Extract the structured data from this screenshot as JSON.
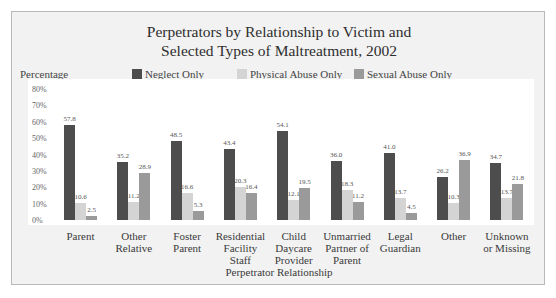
{
  "chart_data": {
    "type": "bar",
    "title": "Perpetrators by Relationship to Victim and Selected Types of Maltreatment, 2002",
    "title_lines": [
      "Perpetrators by Relationship to Victim and",
      "Selected Types of Maltreatment, 2002"
    ],
    "xlabel": "Perpetrator Relationship",
    "ylabel": "Percentage",
    "ylim": [
      0,
      80
    ],
    "yticks": [
      "0%",
      "10%",
      "20%",
      "30%",
      "40%",
      "50%",
      "60%",
      "70%",
      "80%"
    ],
    "grid": false,
    "legend_position": "top",
    "categories": [
      "Parent",
      "Other Relative",
      "Foster Parent",
      "Residential Facility Staff",
      "Child Daycare Provider",
      "Unmarried Partner of Parent",
      "Legal Guardian",
      "Other",
      "Unknown or Missing"
    ],
    "category_lines": [
      [
        "Parent"
      ],
      [
        "Other",
        "Relative"
      ],
      [
        "Foster",
        "Parent"
      ],
      [
        "Residential",
        "Facility",
        "Staff"
      ],
      [
        "Child",
        "Daycare",
        "Provider"
      ],
      [
        "Unmarried",
        "Partner of",
        "Parent"
      ],
      [
        "Legal",
        "Guardian"
      ],
      [
        "Other"
      ],
      [
        "Unknown",
        "or Missing"
      ]
    ],
    "series": [
      {
        "name": "Neglect Only",
        "color": "#4d4d4d",
        "values": [
          57.8,
          35.2,
          48.5,
          43.4,
          54.1,
          36.0,
          41.0,
          26.2,
          34.7
        ]
      },
      {
        "name": "Physical Abuse Only",
        "color": "#d4d4d4",
        "values": [
          10.6,
          11.2,
          16.6,
          20.3,
          12.1,
          18.3,
          13.7,
          10.3,
          13.7
        ]
      },
      {
        "name": "Sexual Abuse Only",
        "color": "#9a9a9a",
        "values": [
          2.5,
          28.9,
          5.3,
          16.4,
          19.5,
          11.2,
          4.5,
          36.9,
          21.8
        ]
      }
    ]
  }
}
